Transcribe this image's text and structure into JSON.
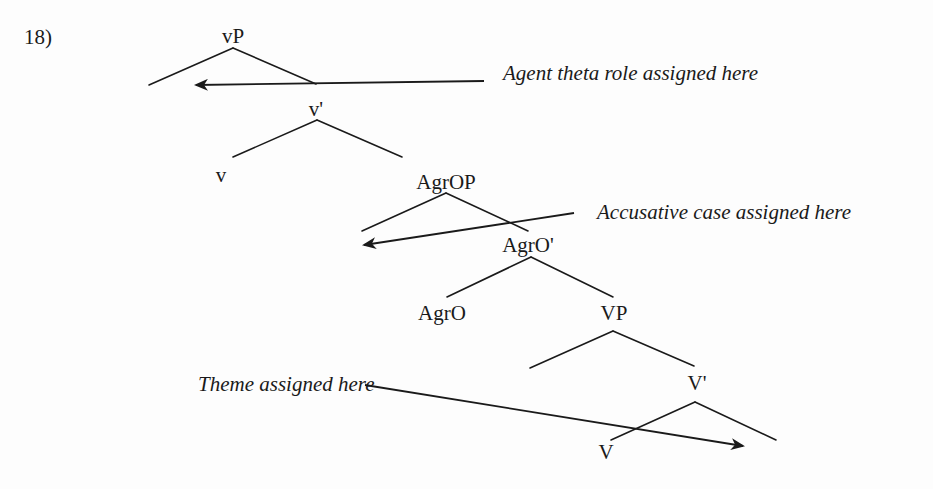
{
  "example": {
    "number": "18)"
  },
  "tree": {
    "nodes": {
      "vP": "vP",
      "v_bar": "v'",
      "v": "v",
      "AgrOP": "AgrOP",
      "AgrO_bar": "AgrO'",
      "AgrO": "AgrO",
      "VP": "VP",
      "V_bar": "V'",
      "V": "V"
    },
    "structure": [
      {
        "parent": "vP",
        "children": [
          "(specifier)",
          "v'"
        ]
      },
      {
        "parent": "v'",
        "children": [
          "v",
          "AgrOP"
        ]
      },
      {
        "parent": "AgrOP",
        "children": [
          "(specifier)",
          "AgrO'"
        ]
      },
      {
        "parent": "AgrO'",
        "children": [
          "AgrO",
          "VP"
        ]
      },
      {
        "parent": "VP",
        "children": [
          "(specifier)",
          "V'"
        ]
      },
      {
        "parent": "V'",
        "children": [
          "V",
          "(complement)"
        ]
      }
    ]
  },
  "annotations": {
    "agent": "Agent theta role assigned here",
    "accusative": "Accusative case assigned here",
    "theme": "Theme assigned here"
  },
  "colors": {
    "ink": "#1a1a1a",
    "background": "#fdfdfd"
  }
}
